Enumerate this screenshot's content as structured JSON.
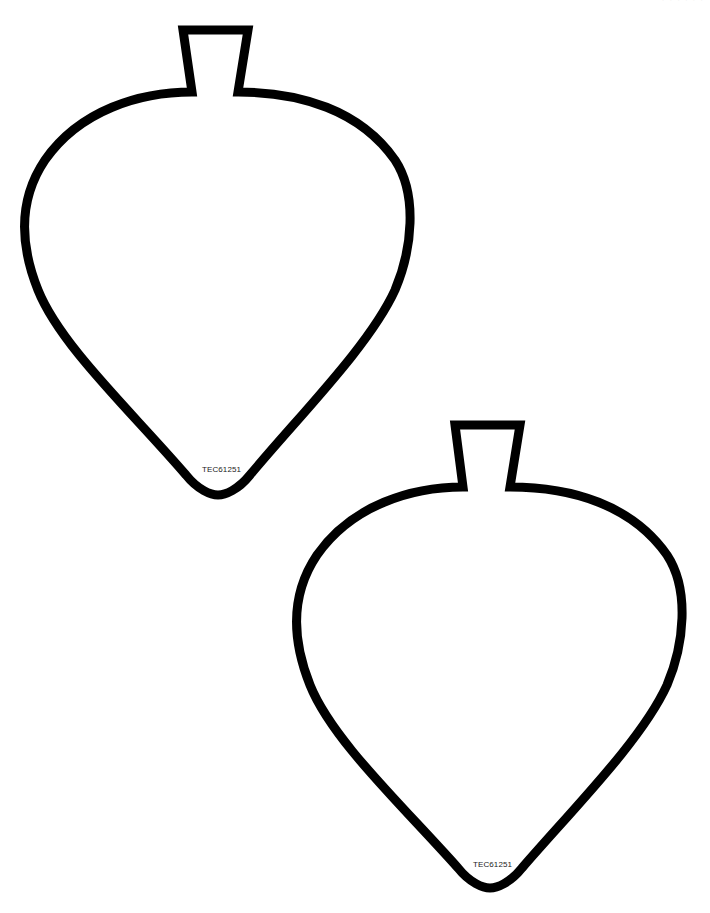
{
  "page": {
    "header_fragment": "· · ·  · · ·",
    "background_color": "#ffffff",
    "outline_color": "#000000",
    "outline_width": 9
  },
  "shapes": [
    {
      "name": "ornament-outline-top-left",
      "code_label": "TEC61251"
    },
    {
      "name": "ornament-outline-bottom-right",
      "code_label": "TEC61251"
    }
  ]
}
